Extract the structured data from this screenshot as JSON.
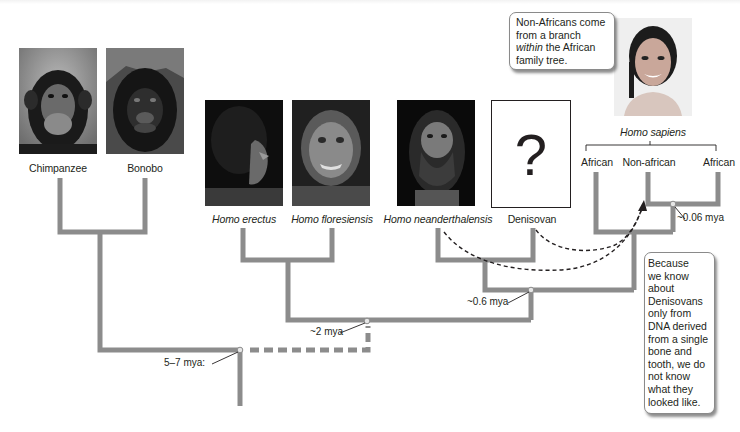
{
  "figure": {
    "type": "phylogenetic-tree",
    "branch_color": "#8c8c8c",
    "dash_color": "#231f20"
  },
  "taxa": [
    {
      "id": "chimpanzee",
      "label": "Chimpanzee",
      "italic": false,
      "image": "chimpanzee-photo"
    },
    {
      "id": "bonobo",
      "label": "Bonobo",
      "italic": false,
      "image": "bonobo-photo"
    },
    {
      "id": "homo-erectus",
      "label": "Homo erectus",
      "italic": true,
      "image": "homo-erectus-reconstruction"
    },
    {
      "id": "homo-floresiensis",
      "label": "Homo floresiensis",
      "italic": true,
      "image": "homo-floresiensis-reconstruction"
    },
    {
      "id": "homo-neanderthalensis",
      "label": "Homo neanderthalensis",
      "italic": true,
      "image": "homo-neanderthalensis-reconstruction"
    },
    {
      "id": "denisovan",
      "label": "Denisovan",
      "italic": false,
      "image": "question-mark-box",
      "placeholder_glyph": "?"
    }
  ],
  "sapiens": {
    "title": "Homo sapiens",
    "image": "homo-sapiens-woman-photo",
    "groups": [
      "African",
      "Non-african",
      "African"
    ]
  },
  "nodes": [
    {
      "id": "root",
      "label": "5–7 mya:"
    },
    {
      "id": "homo",
      "label": "~2 mya"
    },
    {
      "id": "archaic",
      "label": "~0.6 mya"
    },
    {
      "id": "sapiens",
      "label": "~0.06 mya"
    }
  ],
  "callouts": {
    "non_african": {
      "line1": "Non-Africans come",
      "line2": "from a branch",
      "line3_italic": "within",
      "line3_rest": " the African",
      "line4": "family tree."
    },
    "denisovan": {
      "lines": [
        "Because",
        "we know",
        "about",
        "Denisovans",
        "only from",
        "DNA derived",
        "from a single",
        "bone and",
        "tooth, we do",
        "not know",
        "what they",
        "looked like."
      ]
    }
  },
  "gene_flow_arrows": [
    {
      "from": "homo-neanderthalensis",
      "to": "non-african"
    },
    {
      "from": "denisovan",
      "to": "non-african"
    }
  ]
}
